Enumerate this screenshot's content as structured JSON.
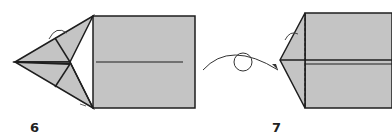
{
  "diagram": {
    "type": "origami-instructions",
    "colors": {
      "paper": "#c4c4c4",
      "stroke": "#1e1e1e",
      "background": "#ffffff"
    },
    "steps": [
      {
        "number": "6",
        "description": "Kite-shaped point on left of rectangle with fold lines; valley fold arrows"
      },
      {
        "number": "7",
        "description": "Model after turning over; triangular point on left"
      }
    ],
    "symbols": [
      {
        "name": "turn-over-arrow",
        "between_steps": [
          "6",
          "7"
        ]
      }
    ]
  }
}
